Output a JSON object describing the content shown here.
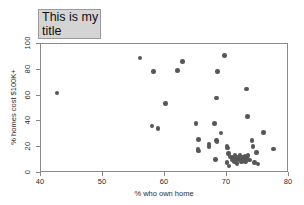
{
  "chart_data": {
    "type": "scatter",
    "title": "This is my title",
    "xlabel": "% who own home",
    "ylabel": "% homes cost $100K+",
    "xlim": [
      40,
      80
    ],
    "ylim": [
      0,
      100
    ],
    "xticks": [
      40,
      50,
      60,
      70,
      80
    ],
    "yticks": [
      0,
      20,
      40,
      60,
      80,
      100
    ],
    "grid": false,
    "legend": null,
    "marker_color": "#575757",
    "title_box_color": "#d4d4d4",
    "series": [
      {
        "name": "states",
        "points": [
          [
            42.6,
            62.0
          ],
          [
            56.0,
            89.0
          ],
          [
            58.1,
            78.5
          ],
          [
            57.9,
            36.5
          ],
          [
            58.9,
            34.5
          ],
          [
            60.1,
            54.0
          ],
          [
            62.0,
            79.5
          ],
          [
            62.8,
            86.5
          ],
          [
            65.0,
            38.5
          ],
          [
            65.4,
            26.0
          ],
          [
            65.3,
            18.0
          ],
          [
            65.4,
            17.0
          ],
          [
            67.1,
            22.5
          ],
          [
            67.1,
            20.5
          ],
          [
            68.0,
            38.5
          ],
          [
            68.3,
            58.0
          ],
          [
            68.5,
            78.5
          ],
          [
            68.3,
            25.0
          ],
          [
            68.4,
            24.5
          ],
          [
            68.1,
            10.5
          ],
          [
            69.0,
            31.0
          ],
          [
            69.6,
            91.0
          ],
          [
            70.0,
            21.0
          ],
          [
            70.1,
            19.5
          ],
          [
            70.2,
            15.0
          ],
          [
            70.0,
            8.0
          ],
          [
            70.3,
            5.5
          ],
          [
            70.6,
            12.5
          ],
          [
            70.8,
            10.0
          ],
          [
            71.0,
            12.0
          ],
          [
            71.2,
            9.0
          ],
          [
            71.3,
            13.5
          ],
          [
            71.5,
            11.0
          ],
          [
            71.6,
            7.5
          ],
          [
            71.8,
            12.5
          ],
          [
            72.0,
            10.5
          ],
          [
            72.1,
            14.0
          ],
          [
            72.3,
            8.5
          ],
          [
            72.5,
            12.0
          ],
          [
            72.7,
            11.0
          ],
          [
            72.9,
            13.0
          ],
          [
            73.0,
            9.0
          ],
          [
            73.2,
            11.5
          ],
          [
            73.4,
            13.5
          ],
          [
            73.3,
            44.0
          ],
          [
            73.1,
            65.0
          ],
          [
            73.6,
            10.0
          ],
          [
            74.0,
            25.0
          ],
          [
            74.2,
            20.5
          ],
          [
            74.4,
            8.0
          ],
          [
            74.8,
            16.0
          ],
          [
            75.0,
            7.0
          ],
          [
            75.9,
            31.5
          ],
          [
            77.5,
            18.5
          ]
        ]
      }
    ]
  }
}
